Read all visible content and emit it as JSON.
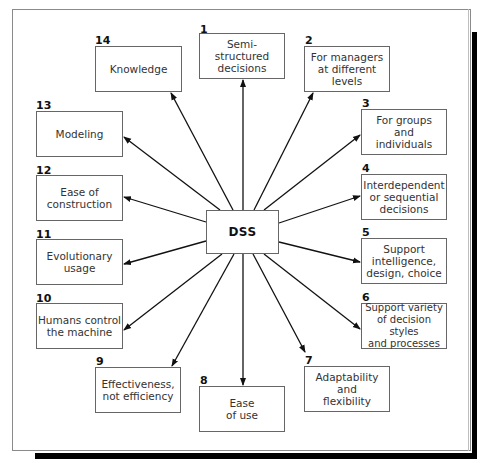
{
  "diagram": {
    "type": "hub-and-spoke",
    "center": {
      "label": "DSS"
    },
    "nodes": [
      {
        "number": "1",
        "label": "Semi-\nstructured\ndecisions"
      },
      {
        "number": "2",
        "label": "For managers\nat different\nlevels"
      },
      {
        "number": "3",
        "label": "For groups\nand\nindividuals"
      },
      {
        "number": "4",
        "label": "Interdependent\nor sequential\ndecisions"
      },
      {
        "number": "5",
        "label": "Support\nintelligence,\ndesign, choice"
      },
      {
        "number": "6",
        "label": "Support variety\nof decision styles\nand processes"
      },
      {
        "number": "7",
        "label": "Adaptability\nand\nflexibility"
      },
      {
        "number": "8",
        "label": "Ease\nof use"
      },
      {
        "number": "9",
        "label": "Effectiveness,\nnot efficiency"
      },
      {
        "number": "10",
        "label": "Humans control\nthe machine"
      },
      {
        "number": "11",
        "label": "Evolutionary\nusage"
      },
      {
        "number": "12",
        "label": "Ease of\nconstruction"
      },
      {
        "number": "13",
        "label": "Modeling"
      },
      {
        "number": "14",
        "label": "Knowledge"
      }
    ],
    "edges": "DSS → each numbered characteristic (arrow pointing outward)"
  }
}
